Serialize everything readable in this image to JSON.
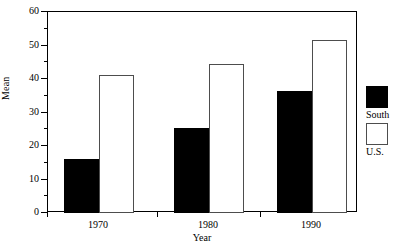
{
  "chart_data": {
    "type": "bar",
    "title": "",
    "xlabel": "Year",
    "ylabel": "Mean",
    "categories": [
      "1970",
      "1980",
      "1990"
    ],
    "series": [
      {
        "name": "South",
        "color": "#000000",
        "values": [
          16,
          25.3,
          36.5
        ]
      },
      {
        "name": "U.S.",
        "color": "#ffffff",
        "values": [
          41.2,
          44.5,
          51.5
        ]
      }
    ],
    "ylim": [
      0,
      60
    ],
    "yticks": [
      0,
      10,
      20,
      30,
      40,
      50,
      60
    ],
    "yticks_minor": [
      5,
      15,
      25,
      35,
      45,
      55
    ],
    "ytick_labels": [
      "0",
      "10",
      "20",
      "30",
      "40",
      "50",
      "60"
    ],
    "grid": false,
    "legend_position": "right"
  },
  "legend": {
    "entries": [
      {
        "label": "South",
        "swatch": "filled-black-square"
      },
      {
        "label": "U.S.",
        "swatch": "open-white-square"
      }
    ]
  }
}
